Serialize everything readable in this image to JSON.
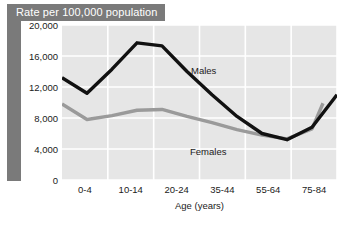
{
  "title": "Rate per 100,000 population",
  "series_labels": {
    "males": "Males",
    "females": "Females"
  },
  "chart_data": {
    "type": "line",
    "title": "Rate per 100,000 population",
    "xlabel": "Age (years)",
    "ylabel": "Rate per 100,000 population",
    "categories": [
      "0-4",
      "5-9",
      "10-14",
      "15-19",
      "20-24",
      "25-34",
      "35-44",
      "45-54",
      "55-64",
      "65-74",
      "75-84",
      "85+"
    ],
    "xtick_labels": [
      "0-4",
      "10-14",
      "20-24",
      "35-44",
      "55-64",
      "75-84"
    ],
    "ytick_labels": [
      "0",
      "4,000",
      "8,000",
      "12,000",
      "16,000",
      "20,000"
    ],
    "yticks": [
      0,
      4000,
      8000,
      12000,
      16000,
      20000
    ],
    "ylim": [
      0,
      20000
    ],
    "grid": true,
    "legend": "in-plot labels",
    "series": [
      {
        "name": "Males",
        "color": "#111111",
        "values": [
          13200,
          11200,
          14300,
          17700,
          17300,
          14000,
          11000,
          8200,
          6000,
          5200,
          6800,
          11000
        ]
      },
      {
        "name": "Females",
        "color": "#9a9a9a",
        "values": [
          9800,
          7800,
          8300,
          9000,
          9100,
          8200,
          7400,
          6500,
          5800,
          5300,
          6600,
          9900
        ]
      }
    ]
  },
  "colors": {
    "banner": "#7a7a7a",
    "plot_background": "#e6e6e6",
    "gridline": "#ffffff",
    "males_line": "#111111",
    "females_line": "#9a9a9a"
  }
}
